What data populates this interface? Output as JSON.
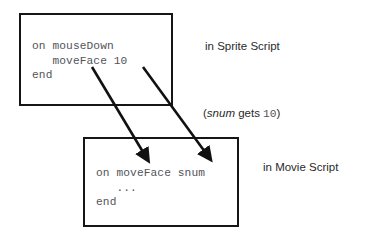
{
  "diagram": {
    "background_color": "#ffffff",
    "border_color": "#161616",
    "code_text_color": "#54545a",
    "label_text_color": "#2a2a2a"
  },
  "sprite_box": {
    "code": "on mouseDown\n   moveFace 10\nend",
    "label": "in Sprite Script"
  },
  "movie_box": {
    "code": "on moveFace snum\n   ...\nend",
    "label": "in Movie Script"
  },
  "pass_note": {
    "open_paren": "(",
    "variable": "snum",
    "verb": " gets ",
    "value": "10",
    "close_paren": ")",
    "full_text": "(snum gets 10)"
  },
  "arrows": [
    {
      "name": "arrow-handler-name",
      "from": {
        "x": 92,
        "y": 67
      },
      "to": {
        "x": 146,
        "y": 157
      }
    },
    {
      "name": "arrow-argument-value",
      "from": {
        "x": 143,
        "y": 67
      },
      "to": {
        "x": 208,
        "y": 156
      }
    }
  ]
}
